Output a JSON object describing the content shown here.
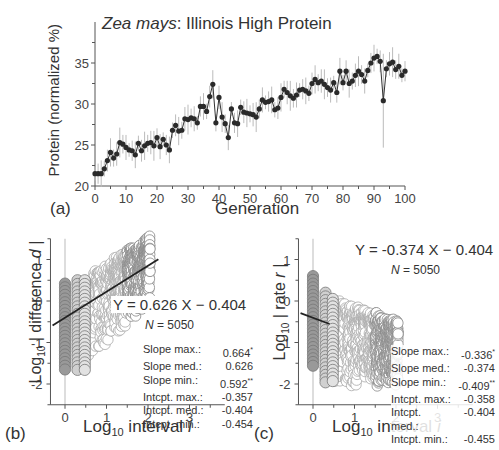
{
  "chart_data": [
    {
      "panel": "(a)",
      "type": "line",
      "title_italic": "Zea mays",
      "title_rest": ": Illinois High Protein",
      "xlabel": "Generation",
      "ylabel": "Protein (normalized %)",
      "xlim": [
        0,
        100
      ],
      "ylim": [
        20,
        40
      ],
      "xticks": [
        0,
        10,
        20,
        30,
        40,
        50,
        60,
        70,
        80,
        90,
        100
      ],
      "yticks": [
        20,
        25,
        30,
        35
      ],
      "grid": false,
      "series": [
        {
          "name": "Protein",
          "x": [
            0,
            1,
            2,
            3,
            4,
            5,
            6,
            7,
            8,
            9,
            10,
            11,
            12,
            13,
            14,
            15,
            16,
            17,
            18,
            19,
            20,
            21,
            22,
            23,
            24,
            25,
            26,
            27,
            28,
            29,
            30,
            31,
            32,
            33,
            34,
            35,
            36,
            37,
            38,
            39,
            40,
            41,
            42,
            43,
            44,
            45,
            46,
            47,
            48,
            49,
            50,
            51,
            52,
            53,
            54,
            55,
            56,
            57,
            58,
            59,
            60,
            61,
            62,
            63,
            64,
            65,
            66,
            67,
            68,
            69,
            70,
            71,
            72,
            73,
            74,
            75,
            76,
            77,
            78,
            79,
            80,
            81,
            82,
            83,
            84,
            85,
            86,
            87,
            88,
            89,
            90,
            91,
            92,
            93,
            94,
            95,
            96,
            97,
            98,
            99,
            100
          ],
          "values": [
            21.5,
            21.5,
            21.5,
            22.1,
            23.1,
            24.1,
            23.4,
            23.9,
            25.3,
            25.1,
            24.7,
            24.4,
            24.3,
            23.8,
            25.2,
            24.3,
            24.9,
            25.2,
            25.3,
            24.9,
            25.9,
            24.8,
            25.7,
            25.0,
            24.4,
            26.8,
            27.4,
            26.7,
            26.8,
            28.2,
            28.1,
            28.3,
            28.2,
            27.7,
            29.7,
            29.7,
            29.1,
            30.9,
            32.4,
            27.7,
            30.8,
            28.4,
            27.6,
            25.9,
            29.4,
            27.7,
            27.6,
            29.6,
            29.0,
            28.9,
            28.8,
            28.7,
            28.4,
            29.4,
            30.5,
            30.2,
            30.3,
            30.5,
            29.3,
            29.5,
            30.8,
            31.8,
            31.4,
            31.0,
            30.7,
            31.1,
            31.7,
            31.8,
            31.6,
            31.3,
            32.5,
            33.0,
            32.6,
            32.8,
            32.4,
            32.0,
            31.7,
            32.6,
            31.4,
            34.0,
            32.6,
            34.0,
            32.5,
            32.8,
            33.5,
            34.0,
            33.6,
            32.8,
            34.1,
            35.0,
            35.6,
            35.8,
            35.2,
            30.4,
            34.3,
            34.9,
            35.1,
            34.2,
            34.6,
            33.5,
            34.0
          ],
          "errorbar_approx": 1.2
        }
      ]
    },
    {
      "panel": "(b)",
      "type": "scatter",
      "xlabel": "Log10 interval i",
      "ylabel": "Log10 | difference d |",
      "xlim": [
        -0.4,
        3.8
      ],
      "ylim": [
        -2.5,
        1.5
      ],
      "xticks": [
        0,
        1,
        2,
        3
      ],
      "yticks": [
        -2,
        -1,
        0,
        1
      ],
      "equation": "Y = 0.626 X − 0.404",
      "N": 5050,
      "fit": {
        "slope": 0.626,
        "intercept": -0.404
      },
      "stats": [
        {
          "label": "Slope max.:",
          "value": "0.664",
          "mark": "*"
        },
        {
          "label": "Slope med.:",
          "value": "0.626",
          "mark": ""
        },
        {
          "label": "Slope min.:",
          "value": "0.592",
          "mark": "**"
        },
        {
          "label": "Intcpt. max.:",
          "value": "-0.357",
          "mark": ""
        },
        {
          "label": "Intcpt. med.:",
          "value": "-0.404",
          "mark": ""
        },
        {
          "label": "Intcpt. min.:",
          "value": "-0.454",
          "mark": ""
        }
      ]
    },
    {
      "panel": "(c)",
      "type": "scatter",
      "xlabel": "Log10 interval i",
      "ylabel": "Log10 | rate r |",
      "xlim": [
        -0.4,
        3.8
      ],
      "ylim": [
        -2.5,
        1.5
      ],
      "xticks": [
        0,
        1,
        2,
        3
      ],
      "yticks": [
        -2,
        -1,
        0,
        1
      ],
      "equation": "Y = -0.374 X − 0.404",
      "N": 5050,
      "fit": {
        "slope": -0.374,
        "intercept": -0.404
      },
      "stats": [
        {
          "label": "Slope max.:",
          "value": "-0.336",
          "mark": "*"
        },
        {
          "label": "Slope med.:",
          "value": "-0.374",
          "mark": ""
        },
        {
          "label": "Slope min.:",
          "value": "-0.409",
          "mark": "**"
        },
        {
          "label": "Intcpt. max.:",
          "value": "-0.358",
          "mark": ""
        },
        {
          "label": "Intcpt. med.:",
          "value": "-0.404",
          "mark": ""
        },
        {
          "label": "Intcpt. min.:",
          "value": "-0.455",
          "mark": ""
        }
      ]
    }
  ],
  "labels": {
    "a": {
      "panel": "(a)",
      "title_italic": "Zea mays",
      "title_rest": ": Illinois High Protein",
      "xlabel": "Generation",
      "ylabel": "Protein (normalized %)"
    },
    "b": {
      "panel": "(b)",
      "xlabel_pre": "Log",
      "xlabel_sub": "10",
      "xlabel_post": " interval ",
      "xlabel_var": "i",
      "ylabel_pre": "Log",
      "ylabel_sub": "10",
      "ylabel_post": " | difference ",
      "ylabel_var": "d",
      "ylabel_end": " |",
      "equation": "Y = 0.626 X − 0.404",
      "n_var": "N",
      "n_text": " = 5050"
    },
    "c": {
      "panel": "(c)",
      "xlabel_pre": "Log",
      "xlabel_sub": "10",
      "xlabel_post": " interval ",
      "xlabel_var": "i",
      "ylabel_pre": "Log",
      "ylabel_sub": "10",
      "ylabel_post": " | rate ",
      "ylabel_var": "r",
      "ylabel_end": " |",
      "equation": "Y = -0.374 X − 0.404",
      "n_var": "N",
      "n_text": " = 5050"
    }
  },
  "colors": {
    "axis": "#555555",
    "line": "#333333",
    "marker": "#2a2a2a",
    "errorbar": "#bbbbbb",
    "scatter_dark_fill": "#999999",
    "scatter_light_fill": "#d0d0d0",
    "scatter_stroke": "#777777",
    "open_stroke": "#aaaaaa",
    "text": "#333333"
  }
}
